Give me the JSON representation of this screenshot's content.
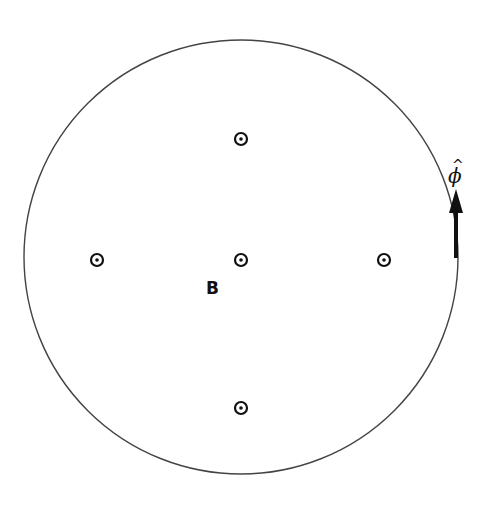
{
  "diagram": {
    "colors": {
      "stroke": "#444444",
      "ink": "#111111",
      "background": "#ffffff"
    },
    "circle": {
      "cx": 241,
      "cy": 257,
      "r": 217
    },
    "field_markers": {
      "symbol": "dot-in-circle (out of page)",
      "points": [
        {
          "name": "top",
          "x": 241,
          "y": 139
        },
        {
          "name": "left",
          "x": 97,
          "y": 260
        },
        {
          "name": "center",
          "x": 241,
          "y": 260
        },
        {
          "name": "right",
          "x": 384,
          "y": 260
        },
        {
          "name": "bottom",
          "x": 241,
          "y": 408
        }
      ]
    },
    "labels": {
      "field": "B",
      "unit_vector": "ϕ",
      "unit_vector_hat": "^"
    },
    "arrow": {
      "x": 456,
      "tip_y": 189,
      "head_base_y": 212,
      "tail_y": 258
    }
  }
}
